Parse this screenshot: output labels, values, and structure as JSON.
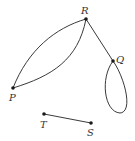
{
  "diagram": {
    "type": "graph",
    "nodes": [
      {
        "id": "R",
        "label": "R",
        "x": 86,
        "y": 19
      },
      {
        "id": "Q",
        "label": "Q",
        "x": 113,
        "y": 61
      },
      {
        "id": "P",
        "label": "P",
        "x": 13,
        "y": 88
      },
      {
        "id": "T",
        "label": "T",
        "x": 44,
        "y": 114
      },
      {
        "id": "S",
        "label": "S",
        "x": 91,
        "y": 123
      }
    ],
    "edges": [
      {
        "from": "P",
        "to": "R",
        "kind": "curve-upper"
      },
      {
        "from": "P",
        "to": "R",
        "kind": "curve-lower"
      },
      {
        "from": "R",
        "to": "Q",
        "kind": "straight"
      },
      {
        "from": "Q",
        "to": "Q",
        "kind": "loop"
      },
      {
        "from": "T",
        "to": "S",
        "kind": "straight"
      }
    ],
    "colors": {
      "edge": "#3a3a3a",
      "node": "#1a1a1a",
      "label": "#333333"
    }
  }
}
